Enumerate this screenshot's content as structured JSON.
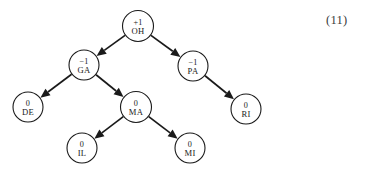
{
  "figure": {
    "type": "tree-diagram",
    "equation_number": "(11)",
    "background_color": "#ffffff",
    "stroke_color": "#1a1a1a"
  },
  "nodes": [
    {
      "id": "OH",
      "label": "OH",
      "balance": "+1",
      "cx": 138,
      "cy": 26,
      "r": 15.5
    },
    {
      "id": "GA",
      "label": "GA",
      "balance": "−1",
      "cx": 84,
      "cy": 65,
      "r": 15.0
    },
    {
      "id": "PA",
      "label": "PA",
      "balance": "−1",
      "cx": 193,
      "cy": 66,
      "r": 15.0
    },
    {
      "id": "DE",
      "label": "DE",
      "balance": "0",
      "cx": 28,
      "cy": 107,
      "r": 15.0
    },
    {
      "id": "MA",
      "label": "MA",
      "balance": "0",
      "cx": 136,
      "cy": 107,
      "r": 15.5
    },
    {
      "id": "RI",
      "label": "RI",
      "balance": "0",
      "cx": 246,
      "cy": 109,
      "r": 15.0
    },
    {
      "id": "IL",
      "label": "IL",
      "balance": "0",
      "cx": 82,
      "cy": 148,
      "r": 15.0
    },
    {
      "id": "MI",
      "label": "MI",
      "balance": "0",
      "cx": 190,
      "cy": 148,
      "r": 15.0
    }
  ],
  "edges": [
    {
      "from": "OH",
      "to": "GA",
      "arrow": true
    },
    {
      "from": "OH",
      "to": "PA",
      "arrow": true
    },
    {
      "from": "GA",
      "to": "DE",
      "arrow": true
    },
    {
      "from": "GA",
      "to": "MA",
      "arrow": true
    },
    {
      "from": "PA",
      "to": "RI",
      "arrow": true
    },
    {
      "from": "MA",
      "to": "IL",
      "arrow": true
    },
    {
      "from": "MA",
      "to": "MI",
      "arrow": true
    }
  ],
  "chart_data": {
    "type": "table",
    "title": "",
    "categories": [
      "OH",
      "GA",
      "PA",
      "DE",
      "MA",
      "RI",
      "IL",
      "MI"
    ],
    "series": [
      {
        "name": "balance factor",
        "values": [
          1,
          -1,
          -1,
          0,
          0,
          0,
          0,
          0
        ]
      }
    ],
    "annotations": [
      "(11)"
    ]
  }
}
